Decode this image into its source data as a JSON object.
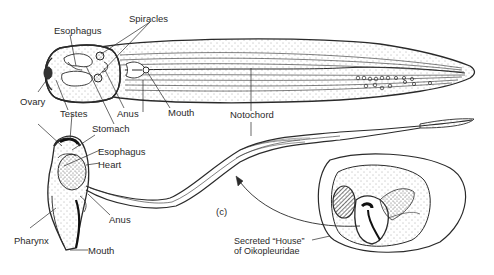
{
  "figure": {
    "panel_label": "(c)",
    "top_view": {
      "labels": {
        "esophagus": "Esophagus",
        "spiracles": "Spiracles",
        "ovary": "Ovary",
        "testes": "Testes",
        "anus": "Anus",
        "mouth": "Mouth",
        "stomach": "Stomach",
        "notochord": "Notochord"
      }
    },
    "side_view": {
      "labels": {
        "esophagus": "Esophagus",
        "heart": "Heart",
        "anus": "Anus",
        "pharynx": "Pharynx",
        "mouth": "Mouth"
      }
    },
    "house": {
      "caption_line1": "Secreted “House”",
      "caption_line2": "of Oikopleuridae"
    },
    "colors": {
      "ink": "#2a2a2a",
      "background": "#ffffff"
    }
  }
}
